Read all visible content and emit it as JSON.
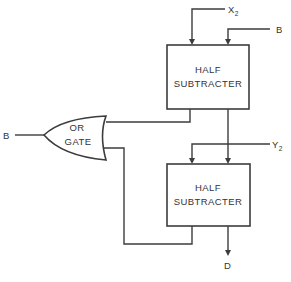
{
  "diagram": {
    "type": "logic-circuit",
    "colors": {
      "line": "#3c3c3c",
      "text": "#333333",
      "background": "#ffffff"
    },
    "inputs": {
      "x2": {
        "label": "X",
        "subscript": "2"
      },
      "b_top": {
        "label": "B"
      },
      "y2": {
        "label": "Y",
        "subscript": "2"
      },
      "b_left": {
        "label": "B"
      }
    },
    "outputs": {
      "d": {
        "label": "D"
      }
    },
    "blocks": {
      "half_subtracter_1": {
        "line1": "HALF",
        "line2": "SUBTRACTER"
      },
      "half_subtracter_2": {
        "line1": "HALF",
        "line2": "SUBTRACTER"
      },
      "or_gate": {
        "line1": "OR",
        "line2": "GATE"
      }
    }
  }
}
